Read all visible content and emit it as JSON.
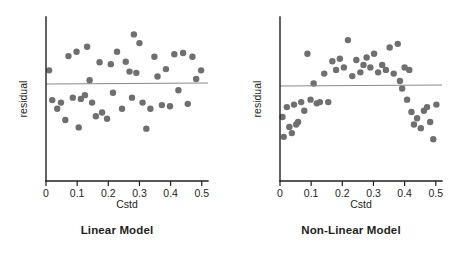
{
  "figure": {
    "background": "#ffffff",
    "point_color": "#6f6f6f",
    "axis_color": "#231f20",
    "ref_line_color": "#8a8a8a",
    "width": 468,
    "height": 260
  },
  "panels": [
    {
      "id": "linear",
      "caption": "Linear Model",
      "ylabel": "residual",
      "xlabel": "Cstd"
    },
    {
      "id": "nonlinear",
      "caption": "Non-Linear Model",
      "ylabel": "residual",
      "xlabel": "Cstd"
    }
  ],
  "chart_data": [
    {
      "type": "scatter",
      "title": "Linear Model",
      "xlabel": "Cstd",
      "ylabel": "residual",
      "xlim": [
        0,
        0.52
      ],
      "ylim": [
        -1.0,
        1.0
      ],
      "xticks": [
        0,
        0.1,
        0.2,
        0.3,
        0.4,
        0.5
      ],
      "xtick_labels": [
        "0",
        "0.1",
        "0.2",
        "0.3",
        "0.4",
        "0.5"
      ],
      "yticks": [],
      "ytick_labels": [],
      "grid": false,
      "legend": null,
      "reference_line": {
        "type": "horizontal",
        "y": 0,
        "color": "#8a8a8a"
      },
      "annotation": "Residuals scattered randomly about zero with no systematic pattern.",
      "x": [
        0.01,
        0.02,
        0.036,
        0.048,
        0.062,
        0.072,
        0.086,
        0.098,
        0.105,
        0.112,
        0.125,
        0.132,
        0.14,
        0.148,
        0.16,
        0.172,
        0.18,
        0.196,
        0.208,
        0.215,
        0.228,
        0.244,
        0.256,
        0.268,
        0.276,
        0.282,
        0.29,
        0.3,
        0.31,
        0.322,
        0.335,
        0.348,
        0.358,
        0.372,
        0.385,
        0.398,
        0.412,
        0.425,
        0.44,
        0.455,
        0.47,
        0.482,
        0.498
      ],
      "y": [
        0.22,
        -0.26,
        -0.4,
        -0.3,
        -0.58,
        0.45,
        -0.22,
        0.52,
        -0.7,
        -0.24,
        -0.18,
        0.6,
        0.06,
        -0.3,
        -0.52,
        0.35,
        -0.46,
        -0.56,
        0.32,
        -0.14,
        0.52,
        -0.4,
        0.36,
        0.2,
        -0.22,
        0.8,
        0.18,
        0.66,
        -0.3,
        -0.72,
        -0.4,
        0.44,
        0.12,
        -0.34,
        0.24,
        -0.36,
        0.48,
        -0.1,
        0.5,
        -0.32,
        0.44,
        0.08,
        0.22
      ]
    },
    {
      "type": "scatter",
      "title": "Non-Linear Model",
      "xlabel": "Cstd",
      "ylabel": "residual",
      "xlim": [
        0,
        0.52
      ],
      "ylim": [
        -1.0,
        1.0
      ],
      "xticks": [
        0,
        0.1,
        0.2,
        0.3,
        0.4,
        0.5
      ],
      "xtick_labels": [
        "0",
        "0.1",
        "0.2",
        "0.3",
        "0.4",
        "0.5"
      ],
      "yticks": [],
      "ytick_labels": [],
      "grid": false,
      "legend": null,
      "reference_line": {
        "type": "horizontal",
        "y": 0,
        "color": "#8a8a8a"
      },
      "annotation": "Residuals show a systematic inverted-U (arch) pattern indicating unmodelled curvature.",
      "x": [
        0.008,
        0.012,
        0.022,
        0.03,
        0.038,
        0.045,
        0.052,
        0.058,
        0.068,
        0.078,
        0.088,
        0.098,
        0.108,
        0.118,
        0.128,
        0.142,
        0.155,
        0.168,
        0.18,
        0.192,
        0.205,
        0.218,
        0.232,
        0.245,
        0.258,
        0.268,
        0.278,
        0.29,
        0.302,
        0.315,
        0.328,
        0.34,
        0.352,
        0.365,
        0.378,
        0.385,
        0.392,
        0.4,
        0.408,
        0.415,
        0.422,
        0.43,
        0.44,
        0.452,
        0.462,
        0.472,
        0.482,
        0.492,
        0.502
      ],
      "y": [
        -0.5,
        -0.82,
        -0.34,
        -0.66,
        -0.76,
        -0.3,
        -0.62,
        -0.58,
        -0.26,
        -0.4,
        0.52,
        -0.22,
        0.04,
        -0.28,
        -0.26,
        0.2,
        -0.26,
        0.4,
        0.26,
        0.44,
        0.3,
        0.74,
        0.16,
        0.42,
        0.22,
        0.34,
        0.46,
        0.3,
        0.52,
        0.22,
        0.34,
        0.26,
        0.62,
        0.2,
        0.68,
        0.08,
        -0.04,
        0.3,
        -0.22,
        0.26,
        -0.42,
        -0.62,
        -0.52,
        -0.68,
        -0.4,
        -0.34,
        -0.58,
        -0.86,
        -0.3
      ]
    }
  ]
}
